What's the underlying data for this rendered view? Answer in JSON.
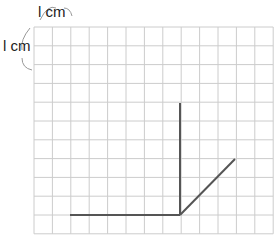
{
  "grid": {
    "origin_x": 34,
    "origin_y": 27,
    "cols": 13,
    "rows": 11,
    "cell_w": 18.4,
    "cell_h": 18.8,
    "line_color": "#cccccc"
  },
  "labels": {
    "top_unit": "l cm",
    "left_unit": "l cm"
  },
  "segments": [
    {
      "name": "horizontal-segment",
      "from": [
        70,
        215
      ],
      "to": [
        180,
        215
      ]
    },
    {
      "name": "vertical-segment",
      "from": [
        180,
        215
      ],
      "to": [
        180,
        103
      ]
    },
    {
      "name": "diagonal-segment",
      "from": [
        180,
        215
      ],
      "to": [
        235,
        159
      ]
    }
  ],
  "segment_color": "#555555"
}
